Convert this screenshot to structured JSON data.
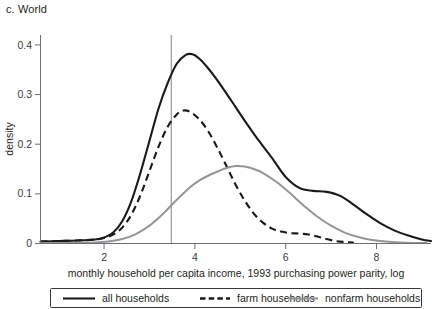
{
  "panel": {
    "label": "c. World"
  },
  "chart_data": {
    "type": "line",
    "title": "c. World",
    "xlabel": "monthly household per capita income, 1993 purchasing power parity, log",
    "ylabel": "density",
    "xlim": [
      0.6,
      9.2
    ],
    "ylim": [
      0,
      0.42
    ],
    "xticks": [
      2,
      4,
      6,
      8
    ],
    "xtick_labels": [
      "2",
      "4",
      "6",
      "8"
    ],
    "yticks": [
      0,
      0.1,
      0.2,
      0.3,
      0.4
    ],
    "ytick_labels": [
      "0",
      "0.1",
      "0.2",
      "0.3",
      "0.4"
    ],
    "grid": false,
    "legend_position": "bottom",
    "annotations": [
      {
        "type": "vline",
        "name": "poverty-reference-line",
        "x": 3.48,
        "color": "#808285"
      }
    ],
    "series": [
      {
        "name": "all households",
        "style": "solid",
        "color": "#1a1a1a",
        "peak": {
          "x": 3.82,
          "y": 0.381
        },
        "x": [
          0.6,
          1.0,
          1.4,
          1.8,
          2.0,
          2.2,
          2.4,
          2.6,
          2.8,
          3.0,
          3.2,
          3.4,
          3.6,
          3.8,
          3.95,
          4.1,
          4.3,
          4.5,
          4.8,
          5.1,
          5.4,
          5.7,
          6.0,
          6.3,
          6.6,
          6.9,
          7.2,
          7.5,
          7.8,
          8.1,
          8.4,
          8.7,
          9.0,
          9.2
        ],
        "y": [
          0.004,
          0.005,
          0.006,
          0.008,
          0.012,
          0.022,
          0.045,
          0.085,
          0.142,
          0.207,
          0.272,
          0.323,
          0.362,
          0.38,
          0.381,
          0.372,
          0.352,
          0.328,
          0.288,
          0.247,
          0.208,
          0.172,
          0.134,
          0.112,
          0.106,
          0.104,
          0.096,
          0.078,
          0.058,
          0.04,
          0.026,
          0.016,
          0.008,
          0.005
        ]
      },
      {
        "name": "farm households",
        "style": "dashed",
        "color": "#1a1a1a",
        "peak": {
          "x": 3.72,
          "y": 0.268
        },
        "x": [
          0.6,
          1.0,
          1.4,
          1.8,
          2.0,
          2.2,
          2.4,
          2.6,
          2.8,
          3.0,
          3.2,
          3.4,
          3.6,
          3.75,
          3.9,
          4.1,
          4.3,
          4.5,
          4.7,
          4.9,
          5.1,
          5.3,
          5.5,
          5.7,
          5.9,
          6.1,
          6.3,
          6.5,
          6.7,
          6.9,
          7.1,
          7.3,
          7.5
        ],
        "y": [
          0.004,
          0.005,
          0.006,
          0.008,
          0.011,
          0.018,
          0.032,
          0.058,
          0.097,
          0.146,
          0.195,
          0.235,
          0.26,
          0.268,
          0.265,
          0.25,
          0.225,
          0.192,
          0.155,
          0.118,
          0.086,
          0.06,
          0.042,
          0.03,
          0.024,
          0.021,
          0.02,
          0.018,
          0.014,
          0.009,
          0.005,
          0.003,
          0.002
        ]
      },
      {
        "name": "nonfarm households",
        "style": "solid-gray",
        "color": "#939598",
        "peak": {
          "x": 4.92,
          "y": 0.156
        },
        "x": [
          0.6,
          1.2,
          1.8,
          2.1,
          2.4,
          2.7,
          3.0,
          3.3,
          3.6,
          3.9,
          4.1,
          4.3,
          4.5,
          4.7,
          4.9,
          5.1,
          5.3,
          5.5,
          5.8,
          6.1,
          6.4,
          6.7,
          7.0,
          7.3,
          7.6,
          7.9,
          8.2,
          8.5,
          8.8,
          9.1
        ],
        "y": [
          0.001,
          0.001,
          0.002,
          0.004,
          0.009,
          0.019,
          0.036,
          0.06,
          0.088,
          0.114,
          0.127,
          0.137,
          0.145,
          0.152,
          0.156,
          0.155,
          0.15,
          0.142,
          0.124,
          0.101,
          0.076,
          0.054,
          0.036,
          0.022,
          0.013,
          0.007,
          0.004,
          0.002,
          0.001,
          0.001
        ]
      }
    ]
  },
  "legend": {
    "items": [
      {
        "label": "all households",
        "style": "solid",
        "color": "#1a1a1a"
      },
      {
        "label": "farm households",
        "style": "dashed",
        "color": "#1a1a1a"
      },
      {
        "label": "nonfarm households",
        "style": "solid",
        "color": "#939598"
      }
    ]
  }
}
